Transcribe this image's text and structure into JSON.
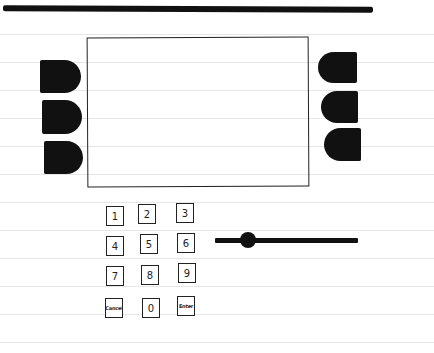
{
  "paper": {
    "ruled_line_color": "#e6e6e6",
    "ruled_lines_y": [
      34,
      62,
      90,
      118,
      146,
      174,
      202,
      230,
      258,
      286,
      314,
      342
    ]
  },
  "header": {
    "bar_color": "#111111"
  },
  "display": {
    "content": ""
  },
  "left_buttons": [
    {
      "id": "left-1"
    },
    {
      "id": "left-2"
    },
    {
      "id": "left-3"
    }
  ],
  "right_buttons": [
    {
      "id": "right-1"
    },
    {
      "id": "right-2"
    },
    {
      "id": "right-3"
    }
  ],
  "keypad": {
    "keys": [
      "1",
      "2",
      "3",
      "4",
      "5",
      "6",
      "7",
      "8",
      "9",
      "Cancel",
      "0",
      "Enter"
    ]
  },
  "slider": {
    "value_percent": 23
  }
}
